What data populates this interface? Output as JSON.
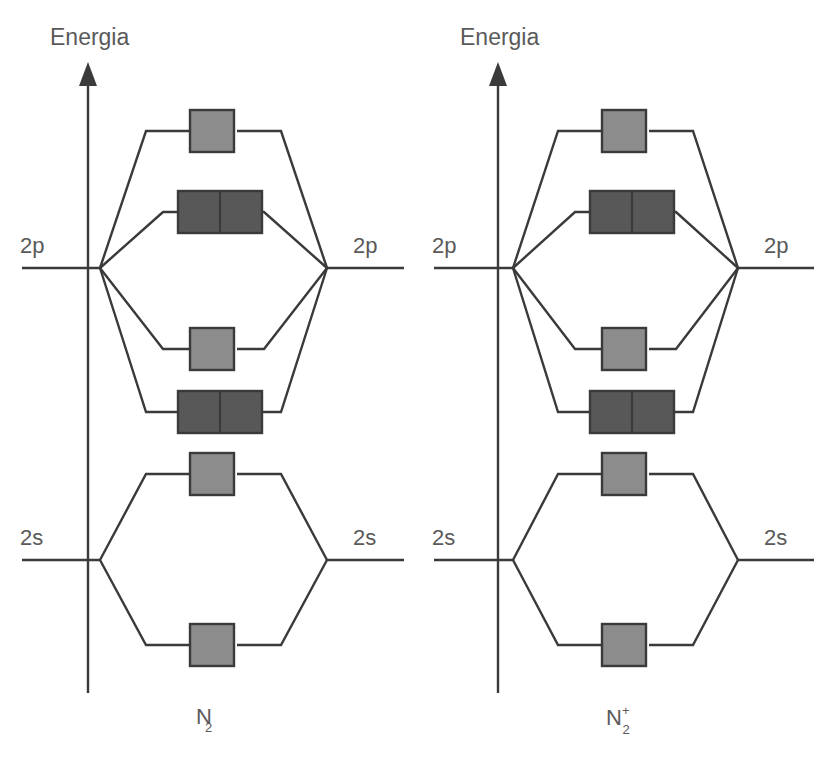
{
  "figure": {
    "kind": "molecular-orbital-energy-level-diagram",
    "line_color": "#3a3a3a",
    "text_color": "#5a5a5a",
    "background": "#ffffff",
    "box_empty_fill": "#8c8c8c",
    "box_filled_fill": "#585858",
    "box_stroke": "#3a3a3a"
  },
  "panels": [
    {
      "id": "left",
      "species_label": "N",
      "species_sub": "2",
      "species_sup": "",
      "axis_label": "Energia",
      "atomic_levels": [
        {
          "name": "2p-left",
          "label": "2p"
        },
        {
          "name": "2p-right",
          "label": "2p"
        },
        {
          "name": "2s-left",
          "label": "2s"
        },
        {
          "name": "2s-right",
          "label": "2s"
        }
      ],
      "molecular_orbitals": [
        {
          "name": "sigma-2p-antibonding",
          "boxes": 1,
          "electrons": 0,
          "energy_y": 131
        },
        {
          "name": "pi-2p-antibonding",
          "boxes": 2,
          "electrons": 0,
          "energy_y": 212
        },
        {
          "name": "sigma-2p-bonding",
          "boxes": 1,
          "electrons": 0,
          "energy_y": 349
        },
        {
          "name": "pi-2p-bonding",
          "boxes": 2,
          "electrons": 0,
          "energy_y": 412
        },
        {
          "name": "sigma-2s-antibonding",
          "boxes": 1,
          "electrons": 0,
          "energy_y": 474
        },
        {
          "name": "sigma-2s-bonding",
          "boxes": 1,
          "electrons": 0,
          "energy_y": 645
        }
      ]
    },
    {
      "id": "right",
      "species_label": "N",
      "species_sub": "2",
      "species_sup": "+",
      "axis_label": "Energia",
      "atomic_levels": [
        {
          "name": "2p-left",
          "label": "2p"
        },
        {
          "name": "2p-right",
          "label": "2p"
        },
        {
          "name": "2s-left",
          "label": "2s"
        },
        {
          "name": "2s-right",
          "label": "2s"
        }
      ],
      "molecular_orbitals": [
        {
          "name": "sigma-2p-antibonding",
          "boxes": 1,
          "electrons": 0,
          "energy_y": 131
        },
        {
          "name": "pi-2p-antibonding",
          "boxes": 2,
          "electrons": 0,
          "energy_y": 212
        },
        {
          "name": "sigma-2p-bonding",
          "boxes": 1,
          "electrons": 0,
          "energy_y": 349
        },
        {
          "name": "pi-2p-bonding",
          "boxes": 2,
          "electrons": 0,
          "energy_y": 412
        },
        {
          "name": "sigma-2s-antibonding",
          "boxes": 1,
          "electrons": 0,
          "energy_y": 474
        },
        {
          "name": "sigma-2s-bonding",
          "boxes": 1,
          "electrons": 0,
          "energy_y": 645
        }
      ]
    }
  ],
  "left": {
    "axis_label": "Energia",
    "level_2p_left": "2p",
    "level_2p_right": "2p",
    "level_2s_left": "2s",
    "level_2s_right": "2s",
    "species": "N",
    "species_sub": "2",
    "species_sup": ""
  },
  "right": {
    "axis_label": "Energia",
    "level_2p_left": "2p",
    "level_2p_right": "2p",
    "level_2s_left": "2s",
    "level_2s_right": "2s",
    "species": "N",
    "species_sub": "2",
    "species_sup": "+"
  }
}
